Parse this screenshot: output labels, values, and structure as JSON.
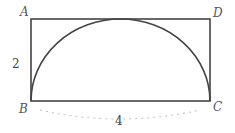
{
  "diagram": {
    "vertices": {
      "A": "A",
      "B": "B",
      "C": "C",
      "D": "D"
    },
    "dimensions": {
      "height_label": "2",
      "width_label": "4"
    },
    "shapes": {
      "rectangle": "ABCD",
      "curve": "semicircle on BC tangent to AD"
    },
    "colors": {
      "stroke": "#444444",
      "dashed": "#bbbbbb"
    }
  }
}
